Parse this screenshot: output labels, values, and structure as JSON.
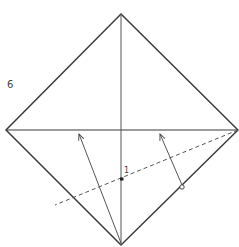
{
  "diagram": {
    "type": "origami-fold-step",
    "step_number_label": "6",
    "point_label": "1",
    "colors": {
      "line": "#3a3a3a",
      "crease": "#555555",
      "background": "#ffffff"
    },
    "shape": {
      "kind": "square-diamond",
      "vertices": {
        "top": [
          121,
          14
        ],
        "right": [
          238,
          130
        ],
        "bottom": [
          121,
          245
        ],
        "left": [
          6,
          130
        ]
      }
    },
    "creases": [
      {
        "name": "horizontal-diagonal",
        "from": [
          6,
          130
        ],
        "to": [
          238,
          130
        ],
        "style": "solid"
      },
      {
        "name": "vertical-diagonal",
        "from": [
          121,
          14
        ],
        "to": [
          121,
          245
        ],
        "style": "solid"
      },
      {
        "name": "dashed-fold-line",
        "from": [
          238,
          130
        ],
        "to": [
          55,
          205
        ],
        "style": "dashed"
      }
    ],
    "arrows": [
      {
        "name": "fold-arrow-left",
        "from": [
          121,
          243
        ],
        "to": [
          79,
          134
        ]
      },
      {
        "name": "fold-arrow-right",
        "from": [
          182,
          186
        ],
        "to": [
          160,
          134
        ]
      }
    ],
    "markers": [
      {
        "name": "reference-point-1",
        "at": [
          122,
          179
        ]
      },
      {
        "name": "circle-marker",
        "at": [
          182,
          187
        ]
      }
    ]
  }
}
